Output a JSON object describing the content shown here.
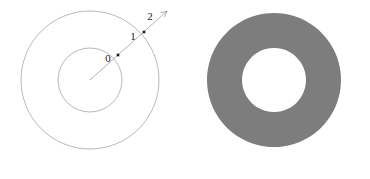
{
  "figure": {
    "background_color": "#ffffff",
    "width": 370,
    "height": 179
  },
  "left_panel": {
    "name": "labeled-concentric-circles",
    "center": {
      "x": 90,
      "y": 80
    },
    "stroke_color": "#9a9a9a",
    "stroke_width": 0.7,
    "circles": [
      {
        "name": "inner-circle",
        "radius": 32
      },
      {
        "name": "outer-circle",
        "radius": 69
      }
    ],
    "ray": {
      "name": "radial-ray",
      "from": {
        "x": 90,
        "y": 80
      },
      "to": {
        "x": 167,
        "y": 11
      },
      "stroke_color": "#8f8f8f",
      "arrowhead": true
    },
    "markers": [
      {
        "label": "0",
        "point": {
          "x": 118,
          "y": 55
        },
        "label_pos": {
          "x": 108,
          "y": 59
        }
      },
      {
        "label": "1",
        "point": {
          "x": 144,
          "y": 32
        },
        "label_pos": {
          "x": 133,
          "y": 37
        }
      },
      {
        "label": "2",
        "point": {
          "x": 158,
          "y": 19
        },
        "label_pos": {
          "x": 150,
          "y": 17
        }
      }
    ],
    "marker_color": "#1a1a1a",
    "marker_size": 2.6
  },
  "right_panel": {
    "name": "shaded-annulus",
    "center": {
      "x": 274,
      "y": 80
    },
    "outer_radius": 67,
    "inner_radius": 32,
    "fill_color": "#7d7d7d",
    "hole_color": "#ffffff"
  },
  "chart_data": {
    "type": "scatter",
    "xlabel": "",
    "ylabel": "",
    "categories": [
      "0",
      "1",
      "2"
    ],
    "values": [
      0,
      1,
      2
    ],
    "annotations": [
      "0",
      "1",
      "2"
    ],
    "grid": false,
    "legend": "none"
  }
}
